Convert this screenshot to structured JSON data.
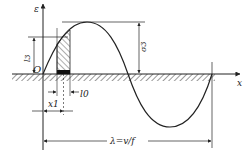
{
  "diagram": {
    "type": "wave-displacement-diagram",
    "axes": {
      "vertical_label": "ε",
      "horizontal_label": "x",
      "origin_label": "O"
    },
    "dimensions": {
      "amplitude_label": "σ3",
      "level_label": "l3",
      "width_label": "l0",
      "position_label": "x1",
      "wavelength_label": "λ=v/f"
    },
    "colors": {
      "line": "#222222",
      "hatch": "#333333",
      "background": "#ffffff"
    }
  }
}
